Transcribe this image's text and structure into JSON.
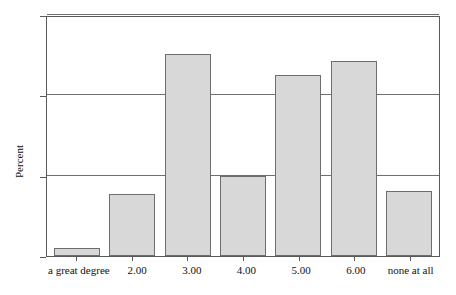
{
  "chart_data": {
    "type": "bar",
    "title": "",
    "xlabel": "",
    "ylabel": "Percent",
    "ylim": [
      0,
      30
    ],
    "yticks": [
      "0",
      "10",
      "20",
      "30"
    ],
    "ytick_values": [
      0,
      10,
      20,
      30
    ],
    "grid": true,
    "legend": null,
    "categories": [
      "a great degree",
      "2.00",
      "3.00",
      "4.00",
      "5.00",
      "6.00",
      "none at all"
    ],
    "values": [
      1.0,
      7.7,
      25.2,
      10.0,
      22.5,
      24.3,
      8.1
    ],
    "bar_fill_color": "#d8d8d8",
    "bar_border_color": "#6d6d6d",
    "axis_color": "#5a5a5a",
    "gridline_color": "#6f6f6f",
    "background_color": "#ffffff"
  }
}
